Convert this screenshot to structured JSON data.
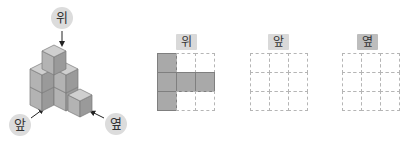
{
  "figure": {
    "view_labels": {
      "top": "위",
      "front": "앞",
      "side": "옆"
    },
    "cube_stack": {
      "description": "isometric stack of unit cubes",
      "colors": {
        "top_face": "#cfcfcf",
        "left_face": "#b3b3b3",
        "right_face": "#9a9a9a",
        "edge": "#7a7a7a"
      }
    }
  },
  "grids": [
    {
      "label": "위",
      "label_style": "light",
      "cells": [
        [
          1,
          0,
          0
        ],
        [
          1,
          1,
          1
        ],
        [
          1,
          0,
          0
        ]
      ]
    },
    {
      "label": "앞",
      "label_style": "light",
      "cells": [
        [
          0,
          0,
          0
        ],
        [
          0,
          0,
          0
        ],
        [
          0,
          0,
          0
        ]
      ]
    },
    {
      "label": "옆",
      "label_style": "dark",
      "cells": [
        [
          0,
          0,
          0
        ],
        [
          0,
          0,
          0
        ],
        [
          0,
          0,
          0
        ]
      ]
    }
  ],
  "colors": {
    "filled_cell": "#a9a9a9",
    "dashed_border": "#b5b5b5",
    "label_bg": "#d9d9d9",
    "label_bg_dark": "#bdbdbd"
  }
}
